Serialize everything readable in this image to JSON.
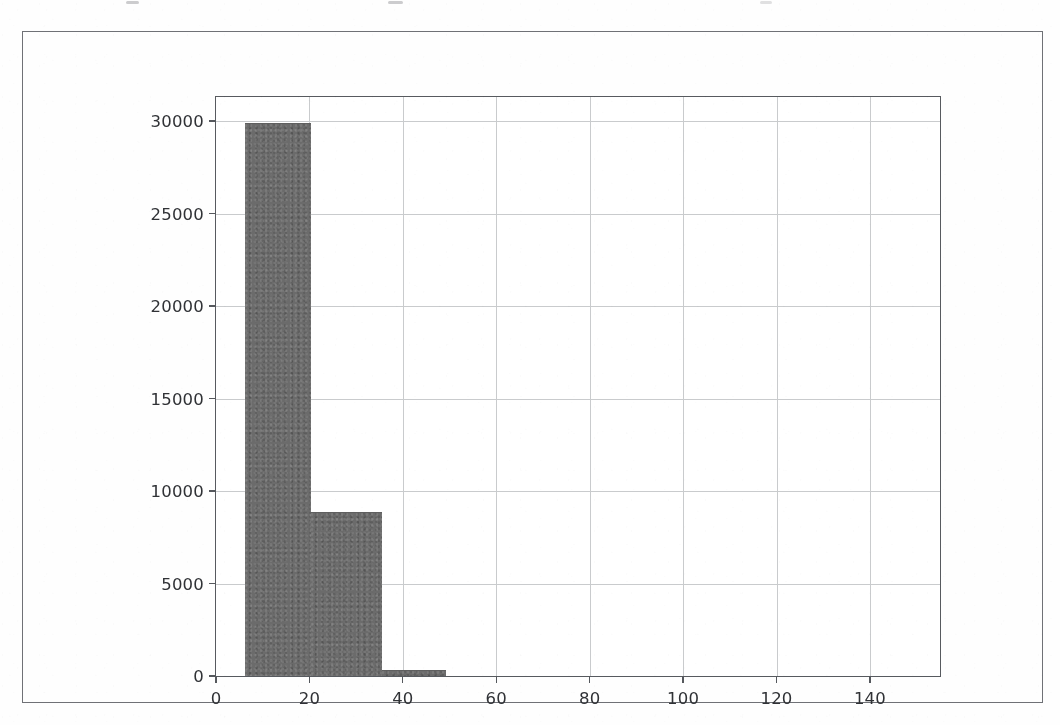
{
  "document": {
    "kind": "scanned-figure-page",
    "figure_border_color": "#6f7176",
    "background_color": "#fefefe"
  },
  "chart_data": {
    "type": "bar",
    "subtype": "histogram",
    "title": "",
    "subtitle": "",
    "xlabel": "",
    "ylabel": "",
    "xlim": [
      0,
      155
    ],
    "ylim": [
      0,
      31300
    ],
    "grid": true,
    "legend": null,
    "bar_color": "#6b6b6b",
    "grid_color": "#c9cbcd",
    "axis_color": "#575a5f",
    "xticks": [
      0,
      20,
      40,
      60,
      80,
      100,
      120,
      140
    ],
    "xtick_labels": [
      "0",
      "20",
      "40",
      "60",
      "80",
      "100",
      "120",
      "140"
    ],
    "yticks": [
      0,
      5000,
      10000,
      15000,
      20000,
      25000,
      30000
    ],
    "ytick_labels": [
      "0",
      "5000",
      "10000",
      "15000",
      "20000",
      "25000",
      "30000"
    ],
    "bins": [
      6.3,
      20.4,
      35.6,
      49.3
    ],
    "categories": [
      "6.3-20.4",
      "20.4-35.6",
      "35.6-49.3"
    ],
    "values": [
      29850,
      8800,
      280
    ],
    "bars": [
      {
        "x0": 6.3,
        "x1": 20.4,
        "height": 29850
      },
      {
        "x0": 20.4,
        "x1": 35.6,
        "height": 8800
      },
      {
        "x0": 35.6,
        "x1": 49.3,
        "height": 280
      }
    ]
  }
}
